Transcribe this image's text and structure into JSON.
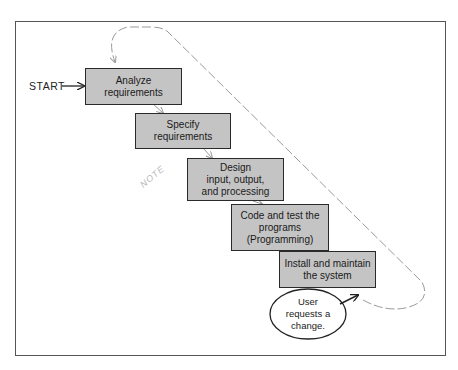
{
  "diagram": {
    "type": "flowchart",
    "start_label": "START",
    "steps": [
      {
        "id": 1,
        "label": "Analyze\nrequirements"
      },
      {
        "id": 2,
        "label": "Specify\nrequirements"
      },
      {
        "id": 3,
        "label": "Design\ninput, output,\nand processing"
      },
      {
        "id": 4,
        "label": "Code and test the\nprograms\n(Programming)"
      },
      {
        "id": 5,
        "label": "Install and maintain\nthe system"
      }
    ],
    "trigger": {
      "label": "User\nrequests a\nchange."
    },
    "annotation": "NOTE",
    "loop": {
      "style": "dashed",
      "from": "trigger",
      "to": "step-1"
    },
    "colors": {
      "box_fill": "#c4c4c4",
      "box_border": "#2a2a2a",
      "loop": "#9a9a9a",
      "frame": "#555555"
    }
  }
}
